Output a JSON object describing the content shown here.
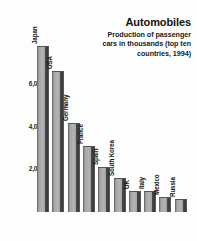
{
  "chart_data": {
    "type": "bar",
    "title": "Automobiles",
    "subtitle": "Production of passenger cars in thousands (top ten countries, 1994)",
    "subtitle_lines": [
      "Production of passenger",
      "cars in thousands (top ten",
      "countries, 1994)"
    ],
    "xlabel": "",
    "ylabel": "",
    "ylim": [
      0,
      8400
    ],
    "grid": false,
    "legend": "none",
    "categories": [
      "Japan",
      "USA",
      "Germany",
      "France",
      "Spain",
      "South Korea",
      "UK",
      "Italy",
      "Mexico",
      "Russia"
    ],
    "values": [
      7800,
      6600,
      4200,
      3100,
      2100,
      1600,
      1000,
      1000,
      700,
      600
    ],
    "tick_labels": [
      "6,000",
      "4,000",
      "2,000"
    ],
    "tick_values": [
      6000,
      4000,
      2000
    ],
    "units": "thousands of cars",
    "year": 1994
  },
  "colors": {
    "background": "#fdfdfd",
    "bar_face": "#b4b4b4",
    "bar_side": "#3a3a3a",
    "text": "#121212"
  }
}
